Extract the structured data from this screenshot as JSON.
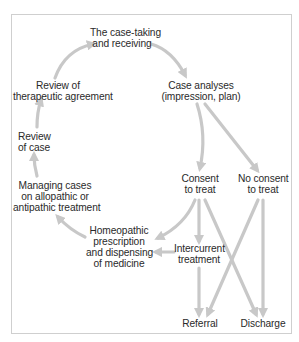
{
  "diagram": {
    "colors": {
      "arrow": "#c8c8c8",
      "text": "#2a2a2a",
      "frame": "#cfcfcf"
    },
    "nodes": {
      "case_taking": {
        "lines": [
          "The case-taking",
          "and receiving"
        ]
      },
      "case_analyses": {
        "lines": [
          "Case analyses",
          "(impression, plan)"
        ]
      },
      "review_agreement": {
        "lines": [
          "Review of",
          "therapeutic agreement"
        ]
      },
      "review_case": {
        "lines": [
          "Review",
          "of case"
        ]
      },
      "managing_cases": {
        "lines": [
          "Managing cases",
          "on allopathic or",
          "antipathic treatment"
        ]
      },
      "consent": {
        "lines": [
          "Consent",
          "to treat"
        ]
      },
      "no_consent": {
        "lines": [
          "No consent",
          "to treat"
        ]
      },
      "homeopathic": {
        "lines": [
          "Homeopathic",
          "prescription",
          "and dispensing",
          "of medicine"
        ]
      },
      "intercurrent": {
        "lines": [
          "Intercurrent",
          "treatment"
        ]
      },
      "referral": {
        "lines": [
          "Referral"
        ]
      },
      "discharge": {
        "lines": [
          "Discharge"
        ]
      }
    },
    "edges": [
      {
        "from": "case_taking",
        "to": "case_analyses"
      },
      {
        "from": "case_analyses",
        "to": "consent"
      },
      {
        "from": "case_analyses",
        "to": "no_consent"
      },
      {
        "from": "consent",
        "to": "homeopathic"
      },
      {
        "from": "consent",
        "to": "intercurrent"
      },
      {
        "from": "consent",
        "to": "discharge"
      },
      {
        "from": "no_consent",
        "to": "referral"
      },
      {
        "from": "no_consent",
        "to": "discharge"
      },
      {
        "from": "intercurrent",
        "to": "homeopathic"
      },
      {
        "from": "intercurrent",
        "to": "referral"
      },
      {
        "from": "homeopathic",
        "to": "managing_cases"
      },
      {
        "from": "managing_cases",
        "to": "review_case"
      },
      {
        "from": "review_case",
        "to": "review_agreement"
      },
      {
        "from": "review_agreement",
        "to": "case_taking"
      }
    ]
  }
}
